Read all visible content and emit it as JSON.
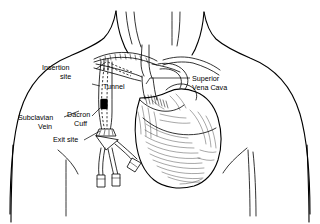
{
  "diagram": {
    "style": "black and white line drawing, pen and ink hatching",
    "background_color": "#ffffff",
    "ink_color": "#000000"
  },
  "labels": [
    {
      "id": "insertion-site",
      "line1": "Insertion",
      "line2": "site",
      "text_x": 42,
      "text_y": 70,
      "anchor": "start",
      "leader": "M 96,69 L 106,63",
      "points_to": "subclavian vein venipuncture point below clavicle"
    },
    {
      "id": "tunnel",
      "line1": "Tunnel",
      "line2": "",
      "text_x": 102,
      "text_y": 89,
      "anchor": "start",
      "leader": "M 100,86 L 92,84",
      "points_to": "subcutaneous tunnel tract of catheter"
    },
    {
      "id": "subclavian-vein",
      "line1": "Subclavian",
      "line2": "Vein",
      "text_x": 19,
      "text_y": 120,
      "anchor": "start",
      "leader": "M 64,117 L 78,112",
      "points_to": "subclavian vein"
    },
    {
      "id": "dacron-cuff",
      "line1": "Dacron",
      "line2": "Cuff",
      "text_x": 68,
      "text_y": 118,
      "anchor": "start",
      "leader": "M 91,117 L 99,110",
      "points_to": "dacron cuff on catheter inside tunnel"
    },
    {
      "id": "exit-site",
      "line1": "Exit site",
      "line2": "",
      "text_x": 54,
      "text_y": 142,
      "anchor": "start",
      "leader": "M 84,140 L 101,131",
      "points_to": "skin exit site of catheter on chest wall"
    },
    {
      "id": "superior-vena-cava",
      "line1": "Superior",
      "line2": "Vena Cava",
      "text_x": 192,
      "text_y": 81,
      "anchor": "start",
      "leader": "M 190,79 L 150,79",
      "points_to": "superior vena cava"
    }
  ],
  "anatomy": [
    {
      "id": "neck",
      "label": "Neck"
    },
    {
      "id": "clavicle",
      "label": "Clavicle"
    },
    {
      "id": "shoulder-left",
      "label": "Left shoulder"
    },
    {
      "id": "shoulder-right",
      "label": "Right shoulder"
    },
    {
      "id": "heart",
      "label": "Heart"
    },
    {
      "id": "superior-vena-cava",
      "label": "Superior vena cava"
    },
    {
      "id": "subclavian-vein",
      "label": "Subclavian vein"
    },
    {
      "id": "aortic-arch",
      "label": "Aortic arch"
    },
    {
      "id": "breast-fold-left",
      "label": "Left breast fold"
    },
    {
      "id": "breast-fold-right",
      "label": "Right breast fold"
    }
  ],
  "device": {
    "name": "Tunneled central venous catheter",
    "lumen_count": 3,
    "parts": [
      {
        "id": "catheter-insertion-segment",
        "label": "Intravenous catheter segment"
      },
      {
        "id": "catheter-tunnel-segment",
        "label": "Subcutaneous tunnel segment"
      },
      {
        "id": "dacron-cuff",
        "label": "Dacron cuff"
      },
      {
        "id": "exit-site-hub",
        "label": "Exit site hub"
      },
      {
        "id": "lumen-tail-1",
        "label": "Lumen 1"
      },
      {
        "id": "lumen-tail-2",
        "label": "Lumen 2"
      },
      {
        "id": "lumen-tail-3",
        "label": "Lumen 3"
      },
      {
        "id": "clamp-1",
        "label": "Clamp 1"
      },
      {
        "id": "clamp-2",
        "label": "Clamp 2"
      },
      {
        "id": "clamp-3",
        "label": "Clamp 3"
      }
    ]
  }
}
